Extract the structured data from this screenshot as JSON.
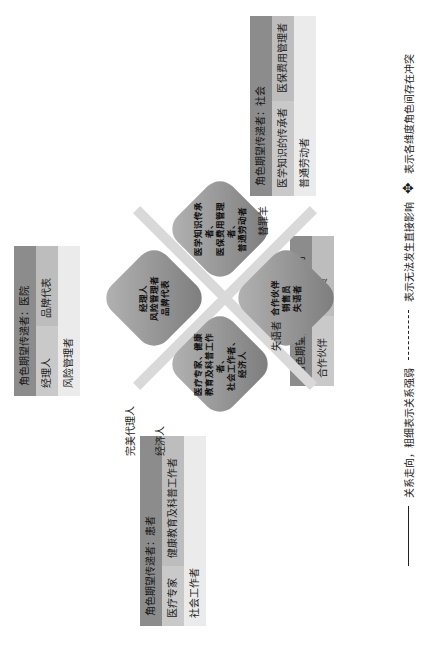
{
  "boxes": {
    "hospital": {
      "title": "角色期望传递者：医院",
      "r1c1": "经理人",
      "r1c2": "品牌代表",
      "r2": "风险管理者"
    },
    "society": {
      "title": "角色期望传递者：社会",
      "r1c1": "医学知识的传承者",
      "r1c2": "医保费用管理者",
      "r2": "普通劳动者"
    },
    "pharma": {
      "title": "角色期望传递者：医药公司",
      "r1c1": "合作伙伴",
      "r1c2": "销售员"
    },
    "patient": {
      "title": "角色期望传递者：患者",
      "r1c1": "医疗专家",
      "r1c2": "健康教育及科普工作者",
      "r2": "社会工作者"
    }
  },
  "center": {
    "hospital_petal": "经理人\n风险管理者\n品牌代表",
    "society_petal": "医学知识传承者、\n医保费用管理者、\n普通劳动者",
    "pharma_petal": "合作伙伴\n销售员\n失语者",
    "patient_petal": "医疗专家、健康\n教育及科普工作者、\n社会工作者、\n经济人"
  },
  "arrow_labels": {
    "scapegoat": "替罪羊",
    "silent": "失语者",
    "perfect_agent": "完美代理人",
    "economic": "经济人"
  },
  "legend": {
    "solid": "关系走向，粗细表示关系强弱",
    "dashed": "表示无法发生直接影响",
    "conflict": "表示各维度角色间存在冲突"
  }
}
